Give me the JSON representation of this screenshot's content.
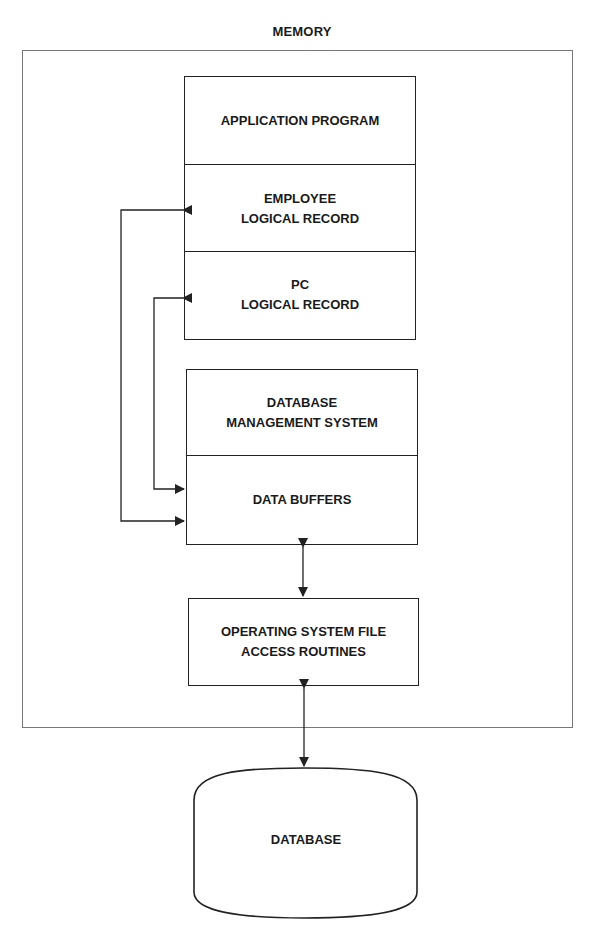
{
  "diagram": {
    "container": {
      "label": "MEMORY"
    },
    "memory_stack_top": [
      {
        "id": "application-program",
        "label": "APPLICATION PROGRAM"
      },
      {
        "id": "employee-logical-record",
        "label": "EMPLOYEE\nLOGICAL RECORD"
      },
      {
        "id": "pc-logical-record",
        "label": "PC\nLOGICAL RECORD"
      }
    ],
    "memory_stack_dbms": [
      {
        "id": "dbms",
        "label": "DATABASE\nMANAGEMENT SYSTEM"
      },
      {
        "id": "data-buffers",
        "label": "DATA BUFFERS"
      }
    ],
    "os_routines": {
      "label": "OPERATING SYSTEM FILE\nACCESS ROUTINES"
    },
    "database": {
      "label": "DATABASE",
      "shape": "cylinder"
    },
    "edges": [
      {
        "from": "data-buffers",
        "to": "employee-logical-record",
        "type": "bidirectional"
      },
      {
        "from": "data-buffers",
        "to": "pc-logical-record",
        "type": "bidirectional"
      },
      {
        "from": "data-buffers",
        "to": "os-routines",
        "type": "bidirectional"
      },
      {
        "from": "os-routines",
        "to": "database",
        "type": "bidirectional"
      }
    ],
    "colors": {
      "line": "#222222",
      "container_border": "#777777",
      "background": "#ffffff"
    }
  }
}
